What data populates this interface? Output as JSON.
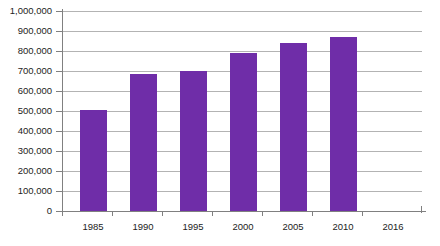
{
  "chart_data": {
    "type": "bar",
    "title": "",
    "subtitle": "",
    "xlabel": "",
    "ylabel": "",
    "categories": [
      "1985",
      "1990",
      "1995",
      "2000",
      "2005",
      "2010",
      "2016"
    ],
    "values": [
      300000,
      505000,
      685000,
      700000,
      790000,
      840000,
      870000
    ],
    "series": [
      {
        "name": "",
        "values": [
          300000,
          505000,
          685000,
          700000,
          790000,
          840000,
          870000
        ]
      }
    ],
    "ylim": [
      0,
      1000000
    ],
    "ytick_values": [
      0,
      100000,
      200000,
      300000,
      400000,
      500000,
      600000,
      700000,
      800000,
      900000,
      1000000
    ],
    "ytick_labels": [
      "0",
      "100,000",
      "200,000",
      "300,000",
      "400,000",
      "500,000",
      "600,000",
      "700,000",
      "800,000",
      "900,000",
      "1,000,000"
    ],
    "grid": true,
    "grid_axis": "y",
    "legend": false,
    "legend_position": "none",
    "bar_color": "#6F2DA8",
    "grid_color": "#B3B3B3",
    "axis_color": "#808080",
    "background_color": "#FFFFFF",
    "annotations": []
  }
}
